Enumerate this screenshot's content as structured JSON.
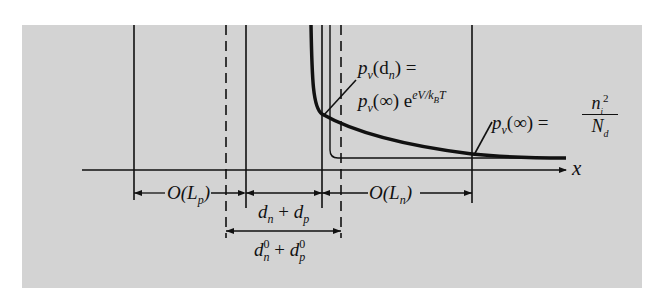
{
  "figure": {
    "type": "minority-carrier-profile-diagram",
    "background_color": "#d3d3d3",
    "line_color": "#111111"
  },
  "axis": {
    "label": "x"
  },
  "annotations": {
    "top_label_line1": {
      "main": "p",
      "sub": "v",
      "rest": "(d",
      "sub2": "n",
      "tail": ") ="
    },
    "top_label_line2": {
      "main": "p",
      "sub": "v",
      "rest": "(∞) e",
      "exp": "eV/k",
      "exp_sub": "B",
      "exp_tail": "T"
    },
    "right_label": {
      "main": "p",
      "sub": "v",
      "rest": "(∞) =",
      "num": "n",
      "num_sub": "i",
      "num_sup": "2",
      "den": "N",
      "den_sub": "d"
    }
  },
  "dimensions": {
    "O_Lp": {
      "text": "O(L",
      "sub": "p",
      "close": ")"
    },
    "O_Ln": {
      "text": "O(L",
      "sub": "n",
      "close": ")"
    },
    "dn_dp": {
      "a": "d",
      "a_sub": "n",
      "op": " + ",
      "b": "d",
      "b_sub": "p"
    },
    "dn0_dp0": {
      "a": "d",
      "a_sub": "n",
      "a_sup": "0",
      "op": " + ",
      "b": "d",
      "b_sub": "p",
      "b_sup": "0"
    }
  }
}
